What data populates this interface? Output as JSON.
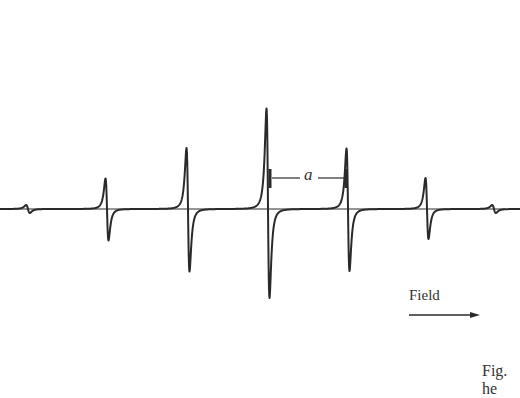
{
  "chart_data": {
    "type": "line",
    "title": "",
    "xlabel": "Field",
    "ylabel": "",
    "annotations": {
      "spacing_label": "a",
      "field_arrow": "Field",
      "caption_fragment": "Fig.\nhe"
    },
    "lines": [
      {
        "name": "satellite-left",
        "center_x": 28,
        "amplitude_up": 8,
        "amplitude_down": 8
      },
      {
        "name": "line-1",
        "center_x": 107,
        "amplitude_up": 61,
        "amplitude_down": 63
      },
      {
        "name": "line-2",
        "center_x": 188,
        "amplitude_up": 122,
        "amplitude_down": 125
      },
      {
        "name": "line-3",
        "center_x": 268,
        "amplitude_up": 201,
        "amplitude_down": 178
      },
      {
        "name": "line-4",
        "center_x": 348,
        "amplitude_up": 121,
        "amplitude_down": 124
      },
      {
        "name": "line-5",
        "center_x": 427,
        "amplitude_up": 62,
        "amplitude_down": 60
      },
      {
        "name": "satellite-right",
        "center_x": 494,
        "amplitude_up": 8,
        "amplitude_down": 8
      }
    ],
    "baseline_y": 209,
    "grid": false,
    "legend": null
  },
  "labels": {
    "a": "a",
    "field": "Field",
    "caption": "Fig.\nhe"
  },
  "colors": {
    "trace": "#2a2a2a",
    "background": "#ffffff"
  }
}
